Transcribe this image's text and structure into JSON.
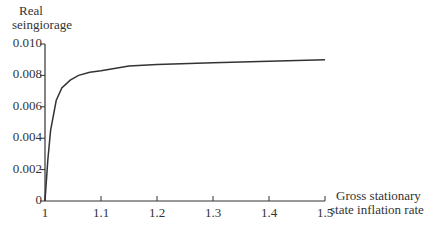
{
  "chart_data": {
    "type": "line",
    "title": "",
    "xlabel": "Gross stationary state inflation rate",
    "ylabel": "Real seingiorage",
    "xlim": [
      1,
      1.5
    ],
    "ylim": [
      0,
      0.01
    ],
    "grid": false,
    "legend": null,
    "x_ticks": [
      "1",
      "1.1",
      "1.2",
      "1.3",
      "1.4",
      "1.5"
    ],
    "y_ticks": [
      "0",
      "0.002",
      "0.004",
      "0.006",
      "0.008",
      "0.010"
    ],
    "series": [
      {
        "name": "Real seingiorage",
        "x": [
          1.0,
          1.005,
          1.01,
          1.02,
          1.03,
          1.045,
          1.06,
          1.08,
          1.1,
          1.15,
          1.2,
          1.3,
          1.4,
          1.5
        ],
        "values": [
          0.0,
          0.0026,
          0.0045,
          0.0064,
          0.0072,
          0.0077,
          0.008,
          0.0082,
          0.0083,
          0.0086,
          0.0087,
          0.0088,
          0.0089,
          0.009
        ]
      }
    ]
  },
  "labels": {
    "ylabel_line1": "Real",
    "ylabel_line2": "seingiorage",
    "xlabel_line1": "Gross stationary",
    "xlabel_line2": "state inflation rate"
  }
}
